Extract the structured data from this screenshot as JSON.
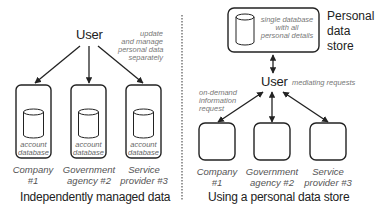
{
  "left_panel": {
    "user_label": "User",
    "annotation": [
      "update",
      "and manage",
      "personal data",
      "separately"
    ],
    "entities": [
      {
        "db_label": [
          "account",
          "database"
        ],
        "name": [
          "Company",
          "#1"
        ]
      },
      {
        "db_label": [
          "account",
          "database"
        ],
        "name": [
          "Government",
          "agency #2"
        ]
      },
      {
        "db_label": [
          "account",
          "database"
        ],
        "name": [
          "Service",
          "provider #3"
        ]
      }
    ],
    "caption": "Independently managed data"
  },
  "right_panel": {
    "store_box_label": [
      "single database",
      "with all",
      "personal details"
    ],
    "store_title": [
      "Personal",
      "data",
      "store"
    ],
    "user_label": "User",
    "user_annotation": "mediating requests",
    "request_annotation": [
      "on-demand",
      "information",
      "request"
    ],
    "entities": [
      {
        "name": [
          "Company",
          "#1"
        ]
      },
      {
        "name": [
          "Government",
          "agency #2"
        ]
      },
      {
        "name": [
          "Service",
          "provider #3"
        ]
      }
    ],
    "caption": "Using a personal data store"
  },
  "colors": {
    "stroke": "#222222",
    "annotation_text": "#777777",
    "label_text": "#555555",
    "divider": "#555555"
  }
}
